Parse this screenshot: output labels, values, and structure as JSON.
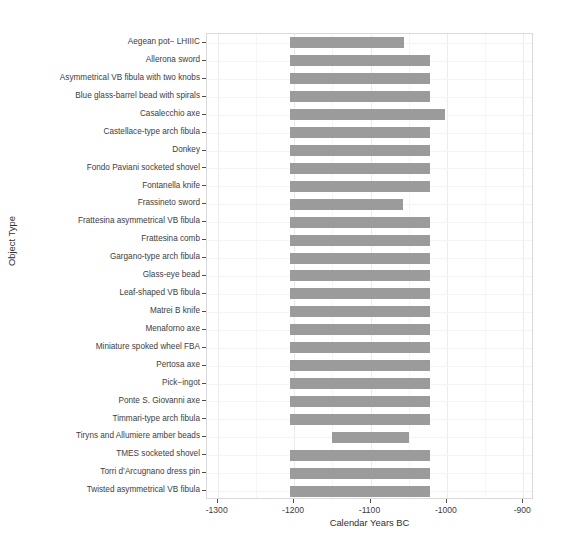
{
  "chart_data": {
    "type": "bar",
    "orientation": "horizontal",
    "title": "",
    "xlabel": "Calendar Years BC",
    "ylabel": "Object Type",
    "xlim": [
      -1314,
      -886
    ],
    "xticks": [
      -1300,
      -1200,
      -1100,
      -1000,
      -900
    ],
    "xticklabels": [
      "-1300",
      "-1200",
      "-1100",
      "-1000",
      "-900"
    ],
    "grid": true,
    "legend": "none",
    "bar_color": "#9b9b9b",
    "panel_background": "#ffffff",
    "note": "Each bar is a date range (start year to end year, BC as negative numbers) for one object type.",
    "categories": [
      "Aegean pot− LHIIIC",
      "Allerona sword",
      "Asymmetrical VB fibula with two knobs",
      "Blue glass-barrel bead with spirals",
      "Casalecchio axe",
      "Castellace-type arch fibula",
      "Donkey",
      "Fondo Paviani socketed shovel",
      "Fontanella knife",
      "Frassineto sword",
      "Frattesina asymmetrical VB fibula",
      "Frattesina comb",
      "Gargano-type arch fibula",
      "Glass-eye bead",
      "Leaf-shaped VB fibula",
      "Matrei B knife",
      "Menaforno axe",
      "Miniature spoked wheel FBA",
      "Pertosa axe",
      "Pick−ingot",
      "Ponte S. Giovanni axe",
      "Timmari-type arch fibula",
      "Tiryns and Allumiere amber beads",
      "TMES socketed shovel",
      "Torri d’Arcugnano dress pin",
      "Twisted asymmetrical VB fibula"
    ],
    "ranges": [
      {
        "label": "Aegean pot− LHIIIC",
        "start": -1205,
        "end": -1056
      },
      {
        "label": "Allerona sword",
        "start": -1205,
        "end": -1022
      },
      {
        "label": "Asymmetrical VB fibula with two knobs",
        "start": -1205,
        "end": -1022
      },
      {
        "label": "Blue glass-barrel bead with spirals",
        "start": -1205,
        "end": -1022
      },
      {
        "label": "Casalecchio axe",
        "start": -1205,
        "end": -1002
      },
      {
        "label": "Castellace-type arch fibula",
        "start": -1205,
        "end": -1022
      },
      {
        "label": "Donkey",
        "start": -1205,
        "end": -1022
      },
      {
        "label": "Fondo Paviani socketed shovel",
        "start": -1205,
        "end": -1022
      },
      {
        "label": "Fontanella knife",
        "start": -1205,
        "end": -1022
      },
      {
        "label": "Frassineto sword",
        "start": -1205,
        "end": -1057
      },
      {
        "label": "Frattesina asymmetrical VB fibula",
        "start": -1205,
        "end": -1022
      },
      {
        "label": "Frattesina comb",
        "start": -1205,
        "end": -1022
      },
      {
        "label": "Gargano-type arch fibula",
        "start": -1205,
        "end": -1022
      },
      {
        "label": "Glass-eye bead",
        "start": -1205,
        "end": -1022
      },
      {
        "label": "Leaf-shaped VB fibula",
        "start": -1205,
        "end": -1022
      },
      {
        "label": "Matrei B knife",
        "start": -1205,
        "end": -1022
      },
      {
        "label": "Menaforno axe",
        "start": -1205,
        "end": -1022
      },
      {
        "label": "Miniature spoked wheel FBA",
        "start": -1205,
        "end": -1022
      },
      {
        "label": "Pertosa axe",
        "start": -1205,
        "end": -1022
      },
      {
        "label": "Pick−ingot",
        "start": -1205,
        "end": -1022
      },
      {
        "label": "Ponte S. Giovanni axe",
        "start": -1205,
        "end": -1022
      },
      {
        "label": "Timmari-type arch fibula",
        "start": -1205,
        "end": -1022
      },
      {
        "label": "Tiryns and Allumiere amber beads",
        "start": -1150,
        "end": -1050
      },
      {
        "label": "TMES socketed shovel",
        "start": -1205,
        "end": -1022
      },
      {
        "label": "Torri d’Arcugnano dress pin",
        "start": -1205,
        "end": -1022
      },
      {
        "label": "Twisted asymmetrical VB fibula",
        "start": -1205,
        "end": -1022
      }
    ]
  }
}
